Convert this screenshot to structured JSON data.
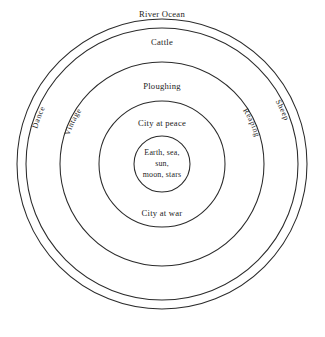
{
  "diagram": {
    "background_color": "#ffffff",
    "stroke_color": "#2b2b2b",
    "text_color": "#1c1c1c",
    "center": {
      "x": 162,
      "y": 164
    },
    "rings": [
      {
        "id": "ring-outer-rim",
        "radius": 145,
        "label": "",
        "label_type": "none"
      },
      {
        "id": "ring-river-ocean",
        "radius": 136,
        "label": "River Ocean",
        "label_type": "band-top"
      },
      {
        "id": "ring-cattle",
        "radius": 102,
        "label": "Cattle",
        "label_type": "band-top"
      },
      {
        "id": "ring-ploughing",
        "radius": 63,
        "label": "Ploughing",
        "label_type": "band-top"
      },
      {
        "id": "ring-city-at-peace",
        "radius": 28,
        "label": "City at peace",
        "label_type": "band-top"
      }
    ],
    "band_labels": [
      {
        "id": "label-river-ocean",
        "text": "River Ocean",
        "x": 162,
        "y": 17
      },
      {
        "id": "label-cattle",
        "text": "Cattle",
        "x": 162,
        "y": 45
      },
      {
        "id": "label-ploughing",
        "text": "Ploughing",
        "x": 162,
        "y": 89
      },
      {
        "id": "label-city-at-peace",
        "text": "City at peace",
        "x": 162,
        "y": 126
      },
      {
        "id": "label-city-at-war",
        "text": "City at war",
        "x": 162,
        "y": 216
      }
    ],
    "core": {
      "id": "core-circle",
      "radius": 28,
      "lines": [
        "Earth, sea,",
        "sun,",
        "moon, stars"
      ]
    },
    "curved_labels": [
      {
        "id": "label-dance",
        "text": "Dance",
        "side": "left",
        "radius": 130
      },
      {
        "id": "label-vintage",
        "text": "Vintage",
        "side": "left",
        "radius": 97
      },
      {
        "id": "label-reaping",
        "text": "Reaping",
        "side": "right",
        "radius": 97
      },
      {
        "id": "label-sheep",
        "text": "Sheep",
        "side": "right",
        "radius": 130
      }
    ]
  }
}
